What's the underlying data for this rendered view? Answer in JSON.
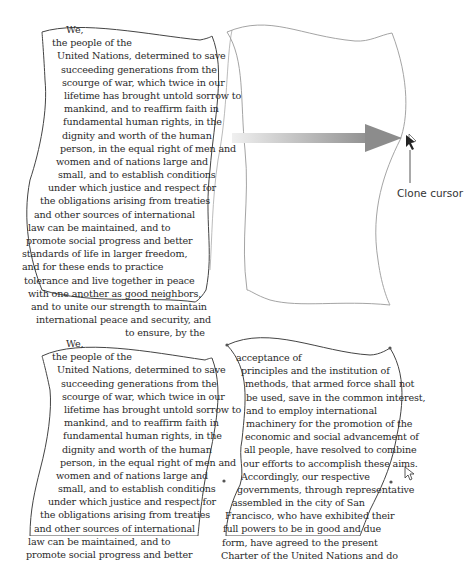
{
  "figure": {
    "callout_label": "Clone cursor",
    "colors": {
      "outline": "#444444",
      "ghost_outline": "#9a9a9a",
      "arrow_start": "#e6e6e6",
      "arrow_end": "#8c8c8c",
      "text": "#2a2a2a"
    }
  },
  "top_left_text": [
    "We,",
    "the people of the",
    "United Nations, determined to save",
    "succeeding generations from the",
    "scourge of war, which twice in our",
    "lifetime has brought untold sorrow to",
    "mankind, and to reaffirm faith in",
    "fundamental human rights, in the",
    "dignity and worth of the human",
    "person, in the equal right of men and",
    "women and of nations large and",
    "small, and to establish conditions",
    "under which justice and respect for",
    "the obligations arising from treaties",
    "and other sources of international",
    "law can be maintained, and to",
    "promote social progress and better",
    "standards of life in larger freedom,",
    "and for these ends to practice",
    "tolerance and live together in peace",
    "with one another as good neighbors,",
    "and to unite our strength to maintain",
    "international peace and security, and",
    "to ensure, by the"
  ],
  "bottom_left_text": [
    "We,",
    "the people of the",
    "United Nations, determined to save",
    "succeeding generations from the",
    "scourge of war, which twice in our",
    "lifetime has brought untold sorrow to",
    "mankind, and to reaffirm faith in",
    "fundamental human rights, in the",
    "dignity and worth of the human",
    "person, in the equal right of men and",
    "women and of nations large and",
    "small, and to establish conditions",
    "under which justice and respect for",
    "the obligations arising from treaties",
    "and other sources of international",
    "law can be maintained, and to",
    "promote social progress and better"
  ],
  "bottom_right_text": [
    "acceptance of",
    "principles and the institution of",
    "methods, that armed force shall not",
    "be used, save in the common interest,",
    "and to employ international",
    "machinery for the promotion of the",
    "economic and social advancement of",
    "all people, have resolved to combine",
    "our efforts to accomplish these aims.",
    "Accordingly, our respective",
    "governments, through representative",
    "assembled in the city of San",
    "Francisco, who have exhibited their",
    "full powers to be in good and due",
    "form, have agreed to the present",
    "Charter of the United Nations and do"
  ]
}
